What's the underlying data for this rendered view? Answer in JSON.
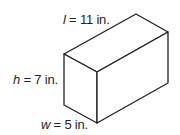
{
  "figure": {
    "type": "rectangular-prism",
    "stroke_color": "#231f20",
    "fill_color": "#ffffff",
    "vertices": {
      "top_back": [
        136,
        14
      ],
      "top_right": [
        168,
        32
      ],
      "top_left": [
        64,
        54
      ],
      "top_front": [
        97,
        72
      ],
      "bottom_left": [
        64,
        105
      ],
      "bottom_front": [
        97,
        123
      ],
      "bottom_right": [
        168,
        83
      ]
    }
  },
  "labels": {
    "length": {
      "variable": "l",
      "text": " = 11 in."
    },
    "height": {
      "variable": "h",
      "text": " = 7 in."
    },
    "width": {
      "variable": "w",
      "text": " = 5 in."
    }
  },
  "dimensions": {
    "length": {
      "value": 11,
      "unit": "in."
    },
    "height": {
      "value": 7,
      "unit": "in."
    },
    "width": {
      "value": 5,
      "unit": "in."
    }
  }
}
